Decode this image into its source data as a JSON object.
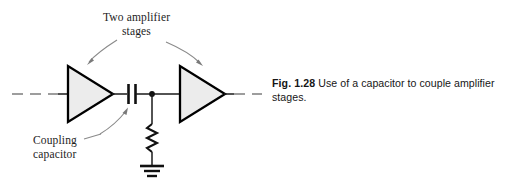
{
  "figure": {
    "annotations": {
      "two_amplifier_stages": "Two amplifier\nstages",
      "coupling_capacitor": "Coupling\ncapacitor"
    },
    "caption": {
      "figure_number": "Fig. 1.28",
      "text": " Use of a capacitor to couple amplifier stages."
    },
    "colors": {
      "line": "#1a1a1a",
      "triangle_fill": "#ececec",
      "triangle_stroke": "#000000",
      "leader": "#8a8a8a",
      "dashed_line": "#7d7d7d",
      "text": "#1d1d1d"
    },
    "components": [
      {
        "name": "amplifier-stage-1",
        "type": "triangle-amplifier"
      },
      {
        "name": "coupling-capacitor",
        "type": "capacitor"
      },
      {
        "name": "junction-node",
        "type": "node-dot"
      },
      {
        "name": "load-resistor",
        "type": "resistor-zigzag"
      },
      {
        "name": "ground",
        "type": "ground-symbol"
      },
      {
        "name": "amplifier-stage-2",
        "type": "triangle-amplifier"
      }
    ]
  }
}
